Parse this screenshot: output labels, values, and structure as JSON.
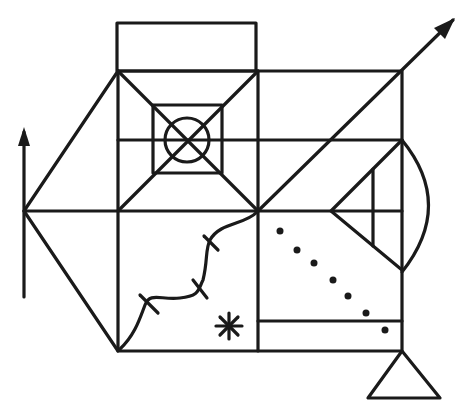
{
  "figure": {
    "stroke_color": "#1a1a1a",
    "background": "#ffffff",
    "elements": {
      "main_rectangle": {
        "x": 118,
        "y": 71,
        "width": 284,
        "height": 280
      },
      "top_box": {
        "x": 117,
        "y": 23,
        "width": 139,
        "height": 48
      },
      "left_triangle_apex": [
        24,
        211
      ],
      "inner_square": {
        "x": 153,
        "y": 105,
        "width": 69,
        "height": 68
      },
      "inner_circle": {
        "cx": 187,
        "cy": 140,
        "r": 22
      },
      "left_arrow": {
        "x": 24,
        "y_bottom": 297,
        "y_tip": 127
      },
      "diagonal_arrow": {
        "from": [
          258,
          211
        ],
        "to": [
          455,
          18
        ]
      },
      "dots": [
        [
          280,
          231
        ],
        [
          297,
          250
        ],
        [
          314,
          263
        ],
        [
          333,
          280
        ],
        [
          348,
          296
        ],
        [
          366,
          313
        ],
        [
          385,
          330
        ]
      ],
      "bottom_triangle": {
        "apex": [
          402,
          351
        ],
        "base_left": [
          368,
          398
        ],
        "base_right": [
          440,
          398
        ]
      },
      "star_center": [
        229,
        326
      ],
      "wavy_line_ticks": 3
    }
  }
}
